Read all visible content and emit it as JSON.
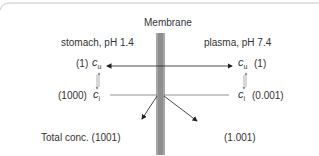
{
  "diagram": {
    "title": "Membrane",
    "left": {
      "compartment": "stomach, pH 1.4",
      "cu_value": "(1)",
      "ci_value": "(1000)",
      "total": "Total conc. (1001)"
    },
    "right": {
      "compartment": "plasma, pH 7.4",
      "cu_value": "(1)",
      "ci_value": "(0.001)",
      "total": "(1.001)"
    },
    "symbols": {
      "c": "c",
      "u": "u",
      "i": "i"
    },
    "colors": {
      "membrane": "#9a9a9a",
      "arrow": "#222222",
      "border": "#bbbbbb",
      "text": "#333333"
    }
  }
}
